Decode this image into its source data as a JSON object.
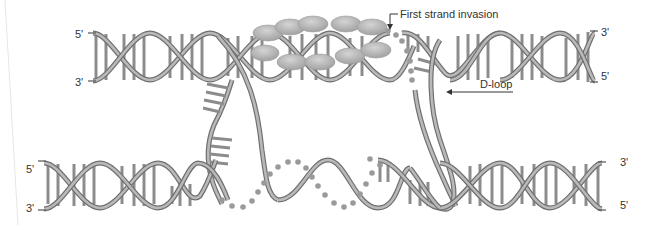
{
  "diagram": {
    "colors": {
      "strand": "#6f6f6f",
      "strand_highlight": "#b9b9b9",
      "base_pair": "#8c8c8c",
      "ssDNA_dots": "#9a9a9a",
      "protein": "#a8a8a8",
      "text": "#333333",
      "background": "#ffffff"
    },
    "top_duplex": {
      "left_top_end": "5'",
      "left_bottom_end": "3'",
      "right_top_end": "3'",
      "right_bottom_end": "5'"
    },
    "bottom_duplex": {
      "left_top_end": "5'",
      "left_bottom_end": "3'",
      "right_top_end": "3'",
      "right_bottom_end": "5'"
    },
    "annotations": {
      "strand_invasion": "First strand invasion",
      "d_loop": "D-loop"
    },
    "elements": {
      "protein_filament": "Rad51/RecA protein filament (ellipses) on top duplex",
      "single_strand_dotted": "dotted single-stranded DNA segments"
    }
  }
}
